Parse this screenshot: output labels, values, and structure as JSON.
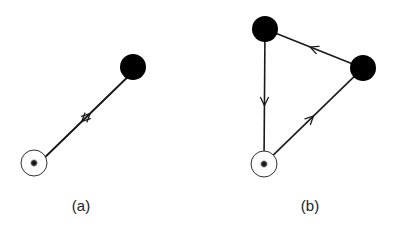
{
  "panels": [
    {
      "id": "a",
      "label": "(a)",
      "label_pos": {
        "x": 81,
        "y": 197
      },
      "nodes": [
        {
          "id": "a-source",
          "type": "open",
          "x": 34,
          "y": 163
        },
        {
          "id": "a-target",
          "type": "filled",
          "x": 133,
          "y": 67
        }
      ],
      "edges": [
        {
          "from": "a-target",
          "to": "a-source",
          "offset": -3.5,
          "arrow_at": 0.55,
          "direction": "toward-source"
        },
        {
          "from": "a-source",
          "to": "a-target",
          "offset": 3.5,
          "arrow_at": 0.55,
          "direction": "toward-target"
        }
      ]
    },
    {
      "id": "b",
      "label": "(b)",
      "label_pos": {
        "x": 310,
        "y": 197
      },
      "nodes": [
        {
          "id": "b-top",
          "type": "filled",
          "x": 265,
          "y": 29
        },
        {
          "id": "b-right",
          "type": "filled",
          "x": 363,
          "y": 68
        },
        {
          "id": "b-bottom",
          "type": "open",
          "x": 264,
          "y": 164
        }
      ],
      "edges": [
        {
          "from": "b-right",
          "to": "b-top",
          "arrow_at": 0.55
        },
        {
          "from": "b-top",
          "to": "b-bottom",
          "arrow_at": 0.58
        },
        {
          "from": "b-bottom",
          "to": "b-right",
          "arrow_at": 0.5
        }
      ]
    }
  ],
  "style": {
    "line_color": "#1a1a1a",
    "filled_node_color": "#000000",
    "open_node_stroke": "#333333",
    "open_node_fill": "#ffffff",
    "node_radius": 13
  }
}
